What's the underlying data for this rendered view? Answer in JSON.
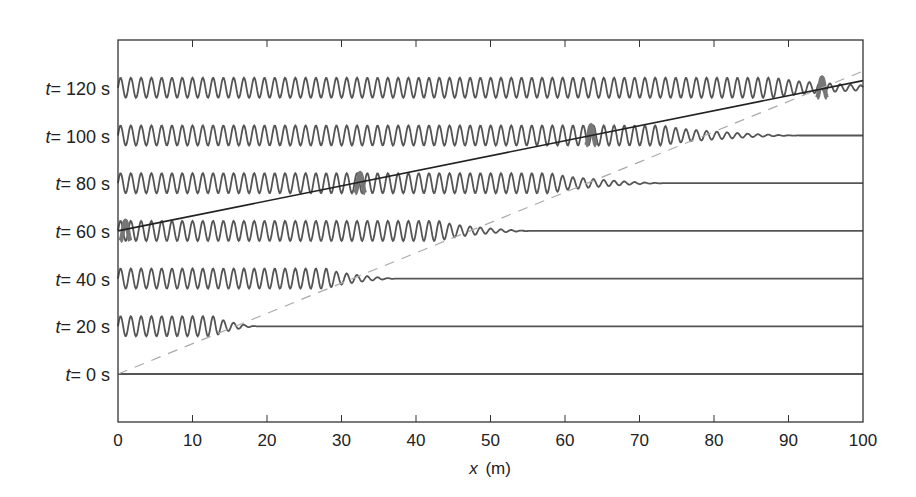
{
  "chart_data": {
    "type": "line",
    "title": "",
    "xlabel": "x (m)",
    "xlabel_var": "x",
    "xlabel_unit": "(m)",
    "ylabel": "",
    "xlim": [
      0,
      100
    ],
    "xticks": [
      0,
      10,
      20,
      30,
      40,
      50,
      60,
      70,
      80,
      90,
      100
    ],
    "xtick_labels": [
      "0",
      "10",
      "20",
      "30",
      "40",
      "50",
      "60",
      "70",
      "80",
      "90",
      "100"
    ],
    "grid": false,
    "legend": null,
    "series": [
      {
        "name": "t = 0 s",
        "t": 0,
        "label_var": "t",
        "label_rest": "= 0 s",
        "wave_full_until_m": 0,
        "decay_end_m": 0
      },
      {
        "name": "t = 20 s",
        "t": 20,
        "label_var": "t",
        "label_rest": "= 20 s",
        "wave_full_until_m": 13,
        "decay_end_m": 19
      },
      {
        "name": "t = 40 s",
        "t": 40,
        "label_var": "t",
        "label_rest": "= 40 s",
        "wave_full_until_m": 28,
        "decay_end_m": 38
      },
      {
        "name": "t = 60 s",
        "t": 60,
        "label_var": "t",
        "label_rest": "= 60 s",
        "wave_full_until_m": 43,
        "decay_end_m": 56
      },
      {
        "name": "t = 80 s",
        "t": 80,
        "label_var": "t",
        "label_rest": "= 80 s",
        "wave_full_until_m": 58,
        "decay_end_m": 74
      },
      {
        "name": "t = 100 s",
        "t": 100,
        "label_var": "t",
        "label_rest": "= 100 s",
        "wave_full_until_m": 73,
        "decay_end_m": 92
      },
      {
        "name": "t = 120 s",
        "t": 120,
        "label_var": "t",
        "label_rest": "= 120 s",
        "wave_full_until_m": 88,
        "decay_end_m": 110
      }
    ],
    "wave": {
      "wavelength_m": 1.38,
      "amplitude_rel": 1.0
    },
    "highlighted_crests": [
      {
        "t": 60,
        "x": 1
      },
      {
        "t": 80,
        "x": 32.5
      },
      {
        "t": 100,
        "x": 63.5
      },
      {
        "t": 120,
        "x": 94.5
      }
    ],
    "annotations": [
      {
        "type": "dashed-line",
        "description": "wave front (phase speed)",
        "from": {
          "x": 0,
          "t": 0
        },
        "to": {
          "x": 100,
          "t": 127
        },
        "color": "#aaaaaa"
      },
      {
        "type": "solid-line",
        "description": "highlighted crest trajectory",
        "from": {
          "x": 0,
          "t": 60
        },
        "to": {
          "x": 100,
          "t": 123
        },
        "color": "#222222"
      }
    ],
    "colors": {
      "wave": "#555555",
      "highlight": "#777777",
      "axis": "#333333",
      "dashed": "#aaaaaa",
      "trajectory": "#222222"
    }
  }
}
